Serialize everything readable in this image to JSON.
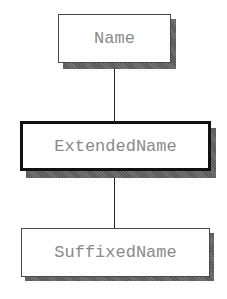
{
  "diagram": {
    "type": "class-hierarchy",
    "nodes": [
      {
        "id": "name",
        "label": "Name",
        "selected": false
      },
      {
        "id": "extended",
        "label": "ExtendedName",
        "selected": true
      },
      {
        "id": "suffixed",
        "label": "SuffixedName",
        "selected": false
      }
    ],
    "edges": [
      {
        "from": "name",
        "to": "extended"
      },
      {
        "from": "extended",
        "to": "suffixed"
      }
    ],
    "colors": {
      "text": "#8a8a8a",
      "border": "#4a4a4a",
      "selected_border": "#111111",
      "shadow": "#666666"
    }
  }
}
